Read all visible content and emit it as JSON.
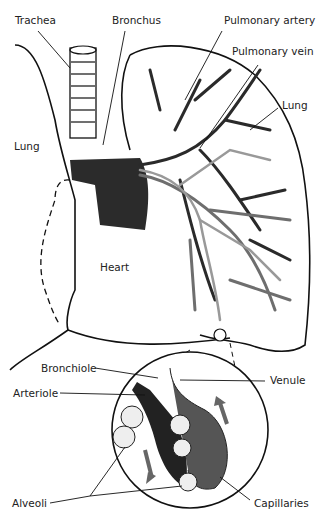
{
  "diagram": {
    "top_labels": {
      "trachea": "Trachea",
      "bronchus": "Bronchus",
      "pulmonary_artery": "Pulmonary artery",
      "pulmonary_vein": "Pulmonary vein",
      "lung_right": "Lung",
      "lung_left": "Lung",
      "heart": "Heart"
    },
    "inset_labels": {
      "bronchiole": "Bronchiole",
      "arteriole": "Arteriole",
      "venule": "Venule",
      "alveoli": "Alveoli",
      "capillaries": "Capillaries"
    },
    "colors": {
      "outline": "#111111",
      "artery": "#2a2a2a",
      "vein": "#6e6e6e",
      "airway": "#e6e6e6"
    }
  }
}
